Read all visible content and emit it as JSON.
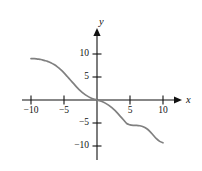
{
  "figure": {
    "kind": "cartesian-graph",
    "background_color": "#ffffff",
    "axis_color": "#111111",
    "curve_color": "#808080"
  },
  "axes": {
    "x_label": "x",
    "y_label": "y",
    "x_ticks": [
      {
        "value": -10,
        "label": "−10"
      },
      {
        "value": -5,
        "label": "−5"
      },
      {
        "value": 5,
        "label": "5"
      },
      {
        "value": 10,
        "label": "10"
      }
    ],
    "y_ticks": [
      {
        "value": 10,
        "label": "10"
      },
      {
        "value": 5,
        "label": "5"
      },
      {
        "value": -5,
        "label": "−5"
      },
      {
        "value": -10,
        "label": "−10"
      }
    ]
  },
  "chart_data": {
    "type": "line",
    "title": "",
    "xlabel": "x",
    "ylabel": "y",
    "xlim": [
      -12.5,
      12.5
    ],
    "ylim": [
      -12.5,
      12.5
    ],
    "grid": false,
    "legend": null,
    "series": [
      {
        "name": "curve",
        "color": "#808080",
        "x": [
          -10.0,
          -9.5,
          -9.0,
          -8.5,
          -8.0,
          -7.5,
          -7.0,
          -6.5,
          -6.0,
          -5.5,
          -5.0,
          -4.5,
          -4.0,
          -3.5,
          -3.0,
          -2.5,
          -2.0,
          -1.5,
          -1.0,
          -0.5,
          0.0,
          0.5,
          1.0,
          1.5,
          2.0,
          2.5,
          3.0,
          3.5,
          4.0,
          4.5,
          5.0,
          5.5,
          6.0,
          6.5,
          7.0,
          7.5,
          8.0,
          8.5,
          9.0,
          9.5,
          10.0
        ],
        "y": [
          9.0,
          9.0,
          8.9,
          8.8,
          8.6,
          8.4,
          8.1,
          7.7,
          7.2,
          6.6,
          5.9,
          5.1,
          4.3,
          3.5,
          2.7,
          2.0,
          1.4,
          0.9,
          0.5,
          0.2,
          0.0,
          -0.2,
          -0.5,
          -0.9,
          -1.4,
          -2.0,
          -2.7,
          -3.5,
          -4.3,
          -5.1,
          -5.4,
          -5.5,
          -5.5,
          -5.6,
          -5.8,
          -6.2,
          -6.8,
          -7.6,
          -8.4,
          -9.0,
          -9.3
        ]
      }
    ],
    "annotations": []
  }
}
